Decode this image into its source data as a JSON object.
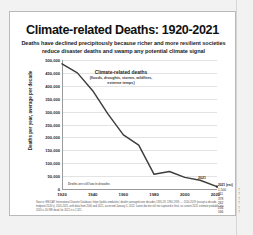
{
  "slide": {
    "title": "Climate-related Deaths: 1920-2021",
    "subtitle": "Deaths have declined precipitously because richer and more resilient societies reduce disaster deaths and swamp any potential climate signal",
    "footnote": "Source: EM-DAT International Disaster Database, https://public.emdat.be/, deaths averaged over decades 1920-29, 1930-1939, … 2010-2019 (except a decade-midpoint 2020's), 2020-2021, with data from 2000 and 2021, accessed January 5, 2022. Latest decline still not captured in final, so current 2021 estimate probably low. 2020 is 16,989 dead, for 2021 it is 2,321."
  },
  "chart_data": {
    "type": "line",
    "title": "Climate-related Deaths: 1920-2021",
    "xlabel": "",
    "ylabel": "Deaths per year, average per decade",
    "xlim": [
      1920,
      2021
    ],
    "ylim": [
      0,
      500000
    ],
    "grid": true,
    "legend": "none",
    "series_color": "#3d3d3d",
    "x": [
      1920,
      1930,
      1940,
      1950,
      1960,
      1970,
      1980,
      1990,
      2000,
      2010,
      2021
    ],
    "values": [
      485000,
      450000,
      381000,
      290000,
      210000,
      170000,
      57000,
      68000,
      45000,
      34000,
      9000
    ],
    "series": [
      {
        "name": "Climate-related deaths",
        "values": [
          485000,
          450000,
          381000,
          290000,
          210000,
          170000,
          57000,
          68000,
          45000,
          34000,
          9000
        ]
      }
    ],
    "ytick_labels": [
      "500,000",
      "450,000",
      "400,000",
      "350,000",
      "300,000",
      "250,000",
      "200,000",
      "150,000",
      "100,000",
      "50,000",
      "0"
    ],
    "ytick_values": [
      500000,
      450000,
      400000,
      350000,
      300000,
      250000,
      200000,
      150000,
      100000,
      50000,
      0
    ],
    "xtick_labels": [
      "1920",
      "1940",
      "1960",
      "1980",
      "2000",
      "2020"
    ],
    "xtick_values": [
      1920,
      1940,
      1960,
      1980,
      2000,
      2020
    ],
    "annotations": [
      {
        "text": "Climate-related deaths",
        "subtext": "(floods, droughts, storms, wildfires, extreme temps)"
      },
      {
        "text": "2021"
      }
    ],
    "baseline_note": "Deaths are still low in decades"
  },
  "data_strip": {
    "header": "2021 (est)",
    "rows": [
      {
        "value": "1,500",
        "mark": "†"
      },
      {
        "value": "711",
        "mark": "†"
      },
      {
        "value": "378",
        "mark": "†"
      },
      {
        "value": "262",
        "mark": "†"
      },
      {
        "value": "234",
        "mark": "†"
      },
      {
        "value": "166",
        "mark": "†"
      }
    ]
  }
}
